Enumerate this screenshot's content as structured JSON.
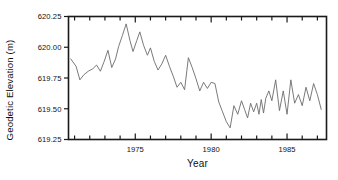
{
  "chart_data": {
    "type": "line",
    "title": "",
    "xlabel": "Year",
    "ylabel": "Geodetic Elevation (m)",
    "xlim": [
      1970.6,
      1987.6
    ],
    "ylim": [
      619.25,
      620.25
    ],
    "grid": false,
    "legend": null,
    "line_color": "#6b6b6b",
    "axis_color": "#1a1a1a",
    "background": "#ffffff",
    "xticks_major": [
      1975,
      1980,
      1985
    ],
    "xtick_labels": [
      "1975",
      "1980",
      "1985"
    ],
    "xticks_minor": [
      1971,
      1972,
      1973,
      1974,
      1976,
      1977,
      1978,
      1979,
      1981,
      1982,
      1983,
      1984,
      1986,
      1987
    ],
    "yticks": [
      619.25,
      619.5,
      619.75,
      620.0,
      620.25
    ],
    "ytick_labels": [
      "619.25",
      "619.50",
      "619.75",
      "620.00",
      "620.25"
    ],
    "series": [
      {
        "name": "Geodetic Elevation",
        "x": [
          1970.75,
          1971.1,
          1971.35,
          1971.6,
          1971.9,
          1972.2,
          1972.45,
          1972.7,
          1972.95,
          1973.2,
          1973.45,
          1973.7,
          1973.9,
          1974.15,
          1974.4,
          1974.65,
          1974.85,
          1975.1,
          1975.3,
          1975.55,
          1975.8,
          1976.0,
          1976.25,
          1976.5,
          1976.75,
          1977.0,
          1977.25,
          1977.5,
          1977.75,
          1978.0,
          1978.25,
          1978.5,
          1978.75,
          1979.0,
          1979.25,
          1979.5,
          1979.75,
          1980.0,
          1980.25,
          1980.5,
          1980.75,
          1981.0,
          1981.25,
          1981.5,
          1981.75,
          1982.0,
          1982.2,
          1982.4,
          1982.6,
          1982.8,
          1983.0,
          1983.15,
          1983.3,
          1983.45,
          1983.6,
          1983.8,
          1984.0,
          1984.25,
          1984.5,
          1984.75,
          1985.0,
          1985.25,
          1985.5,
          1985.75,
          1986.0,
          1986.25,
          1986.5,
          1986.75,
          1987.0,
          1987.25
        ],
        "y": [
          619.905,
          619.845,
          619.735,
          619.775,
          619.805,
          619.825,
          619.855,
          619.805,
          619.885,
          619.975,
          619.835,
          619.905,
          620.005,
          620.095,
          620.19,
          620.055,
          619.965,
          620.055,
          620.125,
          620.015,
          619.935,
          619.995,
          619.885,
          619.815,
          619.865,
          619.935,
          619.845,
          619.765,
          619.675,
          619.715,
          619.655,
          619.915,
          619.835,
          619.745,
          619.645,
          619.715,
          619.665,
          619.715,
          619.705,
          619.555,
          619.475,
          619.395,
          619.345,
          619.525,
          619.455,
          619.565,
          619.495,
          619.425,
          619.545,
          619.475,
          619.545,
          619.455,
          619.575,
          619.465,
          619.585,
          619.645,
          619.565,
          619.735,
          619.485,
          619.645,
          619.455,
          619.735,
          619.545,
          619.615,
          619.525,
          619.675,
          619.565,
          619.705,
          619.615,
          619.495
        ]
      }
    ]
  }
}
